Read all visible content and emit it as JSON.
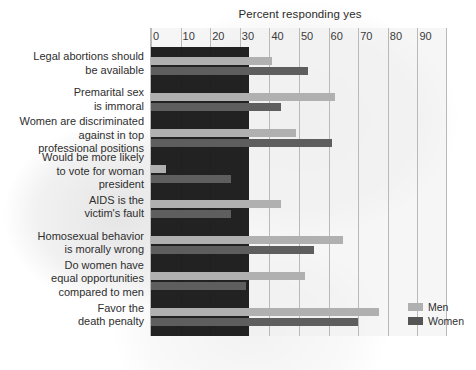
{
  "chart_data": {
    "type": "bar",
    "orientation": "horizontal",
    "title": "Percent responding yes",
    "xlabel": "",
    "ylabel": "",
    "xlim": [
      0,
      100
    ],
    "xticks": [
      0,
      10,
      20,
      30,
      40,
      50,
      60,
      70,
      80,
      90
    ],
    "grid": true,
    "legend_position": "right-bottom",
    "categories": [
      "Legal abortions should be available",
      "Premarital sex is immoral",
      "Women are discriminated against in top professional positions",
      "Would be more likely to vote for woman president",
      "AIDS is the victim's fault",
      "Homosexual behavior is morally wrong",
      "Do women have equal opportunities compared to men",
      "Favor the death penalty"
    ],
    "category_lines": [
      [
        "Legal abortions should",
        "be available"
      ],
      [
        "Premarital sex",
        "is immoral"
      ],
      [
        "Women are discriminated",
        "against in top",
        "professional positions"
      ],
      [
        "Would be more likely",
        "to vote for woman",
        "president"
      ],
      [
        "AIDS is the",
        "victim's fault"
      ],
      [
        "Homosexual behavior",
        "is morally wrong"
      ],
      [
        "Do women have",
        "equal opportunities",
        "compared to men"
      ],
      [
        "Favor the",
        "death penalty"
      ]
    ],
    "series": [
      {
        "name": "Men",
        "color": "#b0b0b0",
        "values": [
          41,
          62,
          49,
          5,
          44,
          65,
          52,
          77
        ]
      },
      {
        "name": "Women",
        "color": "#5e5e5e",
        "values": [
          53,
          44,
          61,
          27,
          27,
          55,
          32,
          70
        ]
      }
    ]
  },
  "legend": {
    "items": [
      {
        "label": "Men",
        "swatch": "men-swatch"
      },
      {
        "label": "Women",
        "swatch": "women-swatch"
      }
    ]
  },
  "colors": {
    "men": "#b0b0b0",
    "women": "#5e5e5e",
    "grid": "#b9b9b9",
    "plot_background": "#eeeeee",
    "dark_overlay": "#1b1b1b",
    "text": "#2e2e2e"
  }
}
